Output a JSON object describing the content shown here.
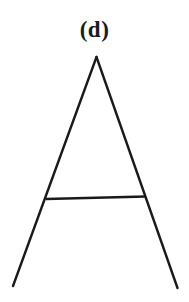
{
  "figure": {
    "caption": "(d)",
    "background_color": "#ffffff",
    "stroke_color": "#1a1a1a",
    "caption_color": "#1a1a1a",
    "shape_name": "letter-A-triangle",
    "canvas": {
      "width": 189,
      "height": 302
    },
    "strokes": [
      {
        "name": "left-leg",
        "x1": 96.5,
        "y1": 57,
        "x2": 13,
        "y2": 286,
        "width": 2.4
      },
      {
        "name": "right-leg",
        "x1": 96.5,
        "y1": 57,
        "x2": 177.5,
        "y2": 288,
        "width": 2.4
      },
      {
        "name": "crossbar",
        "x1": 46,
        "y1": 199,
        "x2": 146,
        "y2": 196.5,
        "width": 2.6
      }
    ]
  }
}
